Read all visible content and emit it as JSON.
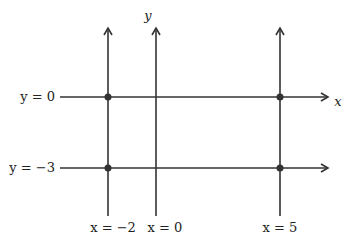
{
  "diagram": {
    "title": "",
    "axis_labels": {
      "x": "x",
      "y": "y"
    },
    "horizontal_lines": [
      {
        "label": "y = 0",
        "y_value": 0,
        "is_axis": true
      },
      {
        "label": "y = −3",
        "y_value": -3,
        "is_axis": false
      }
    ],
    "vertical_lines": [
      {
        "label": "x = −2",
        "x_value": -2,
        "is_axis": false
      },
      {
        "label": "x = 0",
        "x_value": 0,
        "is_axis": true
      },
      {
        "label": "x = 5",
        "x_value": 5,
        "is_axis": false
      }
    ],
    "points": [
      {
        "x": -2,
        "y": 0
      },
      {
        "x": 5,
        "y": 0
      },
      {
        "x": -2,
        "y": -3
      },
      {
        "x": 5,
        "y": -3
      }
    ],
    "colors": {
      "line": "#333333",
      "point": "#333333",
      "text": "#222222"
    }
  }
}
